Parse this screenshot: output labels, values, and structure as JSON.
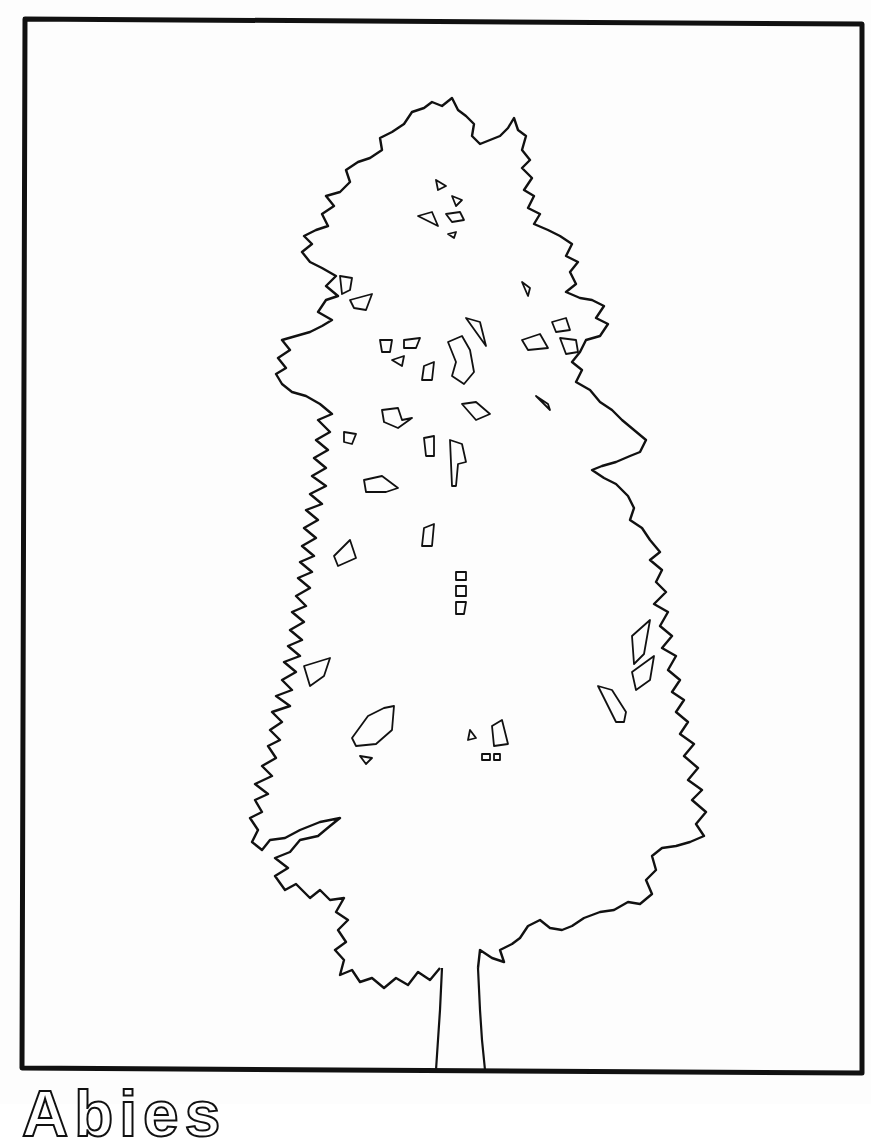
{
  "illustration": {
    "subject": "tree-outline",
    "style": "black line drawing on white",
    "frame_color": "#111111",
    "line_color": "#111111",
    "background_color": "#fdfdfd"
  },
  "caption": {
    "text": "Abies",
    "note": "partially visible, cut off at bottom edge"
  }
}
